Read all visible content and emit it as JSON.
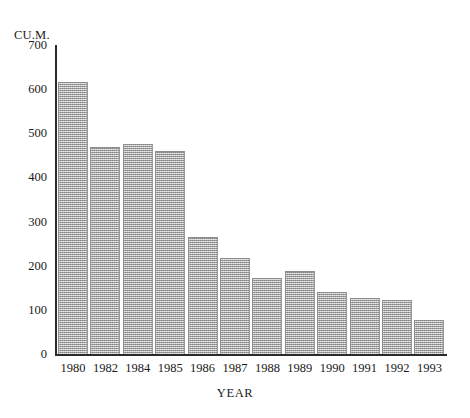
{
  "chart_data": {
    "type": "bar",
    "title": "",
    "subtitle": "",
    "xlabel": "YEAR",
    "ylabel": "CU.M.",
    "categories": [
      "1980",
      "1982",
      "1984",
      "1985",
      "1986",
      "1987",
      "1988",
      "1989",
      "1990",
      "1991",
      "1992",
      "1993"
    ],
    "values": [
      617,
      470,
      475,
      461,
      265,
      218,
      172,
      188,
      141,
      126,
      123,
      76
    ],
    "series": [
      {
        "name": "CU.M.",
        "values": [
          617,
          470,
          475,
          461,
          265,
          218,
          172,
          188,
          141,
          126,
          123,
          76
        ]
      }
    ],
    "ylim": [
      0,
      700
    ],
    "ytick_labels": [
      "700",
      "600",
      "500",
      "400",
      "300",
      "200",
      "100",
      "0"
    ],
    "ytick_values": [
      700,
      600,
      500,
      400,
      300,
      200,
      100,
      0
    ],
    "grid": false,
    "legend": null,
    "legend_position": "none",
    "bar_color": "#a8a8a8",
    "axis_color": "#2b2b2b",
    "background_color": "#ffffff"
  },
  "axes": {
    "y_title": "CU.M.",
    "x_title": "YEAR"
  }
}
